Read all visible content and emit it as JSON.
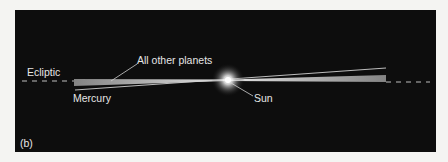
{
  "figure": {
    "panel_label": "(b)",
    "labels": {
      "ecliptic": "Ecliptic",
      "all_other_planets": "All other planets",
      "mercury": "Mercury",
      "sun": "Sun"
    },
    "colors": {
      "background": "#f4f4f2",
      "panel": "#0d0d0d",
      "text": "#e6e6e6",
      "orbit_plane": "#d8d8d8",
      "sun_glow": "#ffffff"
    }
  }
}
